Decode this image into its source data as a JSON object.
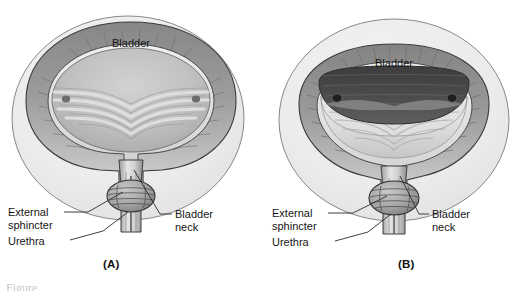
{
  "figure": {
    "style": "grayscale anatomical line illustration",
    "background_color": "#ffffff",
    "disc_color": "#ececec",
    "wall_color": "#9a9a9a",
    "lumen_color_a": "#bdbdbd",
    "lumen_color_b": "#4a4a4a",
    "outline_color": "#2b2b2b"
  },
  "panels": [
    {
      "id": "A",
      "caption": "(A)",
      "state": "relaxed",
      "labels": {
        "bladder": "Bladder",
        "external_sphincter_line1": "External",
        "external_sphincter_line2": "sphincter",
        "urethra": "Urethra",
        "bladder_neck_line1": "Bladder",
        "bladder_neck_line2": "neck"
      }
    },
    {
      "id": "B",
      "caption": "(B)",
      "state": "contracted",
      "labels": {
        "bladder": "Bladder",
        "external_sphincter_line1": "External",
        "external_sphincter_line2": "sphincter",
        "urethra": "Urethra",
        "bladder_neck_line1": "Bladder",
        "bladder_neck_line2": "neck"
      }
    }
  ],
  "footer": {
    "partial_caption": "Figure"
  }
}
